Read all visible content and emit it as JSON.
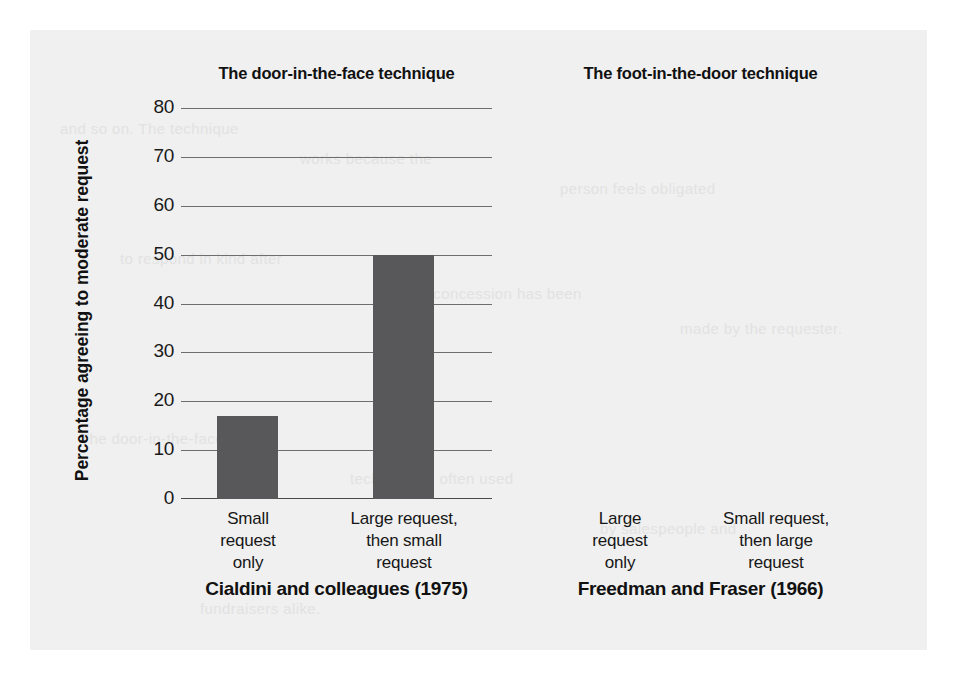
{
  "figure": {
    "background_color": "#f0f0f0",
    "bar_color": "#58585a",
    "axis_color": "#6e6e6e",
    "y_axis_title": "Percentage agreeing to moderate request"
  },
  "ghost_text": [
    "and so on. The technique",
    "works because the",
    "person feels obligated",
    "to respond in kind after",
    "a concession has been",
    "made by the requester.",
    "The door-in-the-face",
    "technique is often used",
    "by salespeople and",
    "fundraisers alike."
  ],
  "y_ticks": [
    "0",
    "10",
    "20",
    "30",
    "40",
    "50",
    "60",
    "70",
    "80"
  ],
  "panels": [
    {
      "title": "The door-in-the-face technique",
      "source": "Cialdini and colleagues (1975)",
      "bars": [
        {
          "label_lines": [
            "Small",
            "request",
            "only"
          ],
          "value": 17
        },
        {
          "label_lines": [
            "Large request,",
            "then small",
            "request"
          ],
          "value": 50
        }
      ]
    },
    {
      "title": "The foot-in-the-door technique",
      "source": "Freedman and Fraser (1966)",
      "bars": [
        {
          "label_lines": [
            "Large",
            "request",
            "only"
          ],
          "value": 17.5
        },
        {
          "label_lines": [
            "Small request,",
            "then large",
            "request"
          ],
          "value": 56
        }
      ]
    }
  ],
  "chart_data": {
    "type": "bar",
    "title": "",
    "xlabel": "",
    "ylabel": "Percentage agreeing to moderate request",
    "ylim": [
      0,
      80
    ],
    "ytick_step": 10,
    "grid": true,
    "legend": "none",
    "panels": [
      {
        "name": "The door-in-the-face technique",
        "subtitle": "Cialdini and colleagues (1975)",
        "categories": [
          "Small request only",
          "Large request, then small request"
        ],
        "values": [
          17,
          50
        ]
      },
      {
        "name": "The foot-in-the-door technique",
        "subtitle": "Freedman and Fraser (1966)",
        "categories": [
          "Large request only",
          "Small request, then large request"
        ],
        "values": [
          17.5,
          56
        ]
      }
    ]
  }
}
